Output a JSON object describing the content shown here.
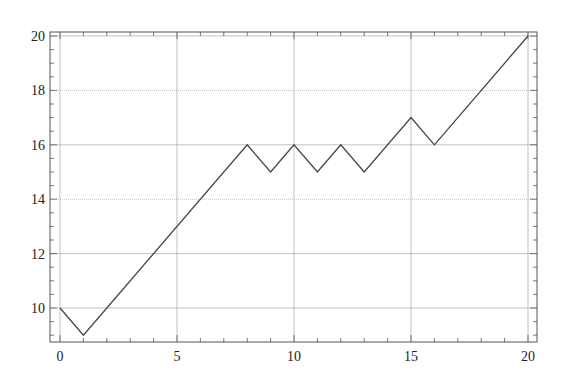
{
  "chart_data": {
    "type": "line",
    "title": "",
    "xlabel": "",
    "ylabel": "",
    "xlim": [
      -0.45,
      20.4
    ],
    "ylim": [
      8.75,
      20.15
    ],
    "grid": true,
    "legend": null,
    "x_ticks": [
      0,
      5,
      10,
      15,
      20
    ],
    "y_ticks": [
      10,
      12,
      14,
      16,
      18,
      20
    ],
    "x_tick_labels": [
      "0",
      "5",
      "10",
      "15",
      "20"
    ],
    "y_tick_labels": [
      "10",
      "12",
      "14",
      "16",
      "18",
      "20"
    ],
    "x_minor_step": 1,
    "y_minor_step": 0.5,
    "series": [
      {
        "name": "path",
        "color": "#444444",
        "x": [
          0,
          1,
          8,
          9,
          10,
          11,
          12,
          13,
          15,
          16,
          20
        ],
        "y": [
          10,
          9,
          16,
          15,
          16,
          15,
          16,
          15,
          17,
          16,
          20
        ]
      }
    ]
  },
  "style": {
    "axis_color": "#555555",
    "grid_color": "#999999",
    "line_color": "#444444"
  }
}
